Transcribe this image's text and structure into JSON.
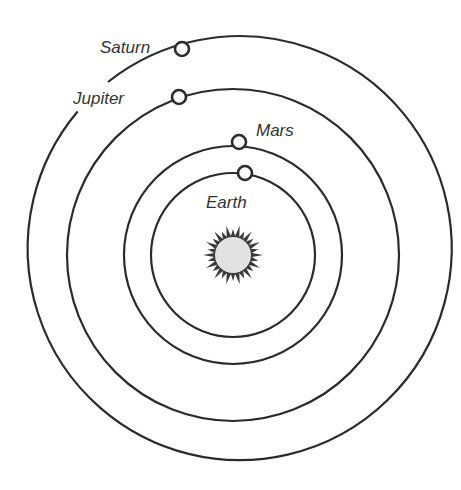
{
  "diagram": {
    "type": "heliocentric solar system",
    "center": {
      "x": 233,
      "y": 255
    },
    "sun": {
      "name": "Sun",
      "labeled": false
    },
    "colors": {
      "line": "#2b2b2b",
      "label": "#333333",
      "sun_fill": "#e2e2e2",
      "background": "#ffffff"
    },
    "planets": [
      {
        "name": "Earth",
        "label": "Earth",
        "orbit_radius": 82,
        "planet_x": 245,
        "planet_y": 173
      },
      {
        "name": "Mars",
        "label": "Mars",
        "orbit_radius": 109,
        "planet_x": 239,
        "planet_y": 142
      },
      {
        "name": "Jupiter",
        "label": "Jupiter",
        "orbit_radius": 166,
        "planet_x": 179,
        "planet_y": 97
      },
      {
        "name": "Saturn",
        "label": "Saturn",
        "orbit_radius": 212,
        "planet_x": 182,
        "planet_y": 49
      }
    ]
  }
}
